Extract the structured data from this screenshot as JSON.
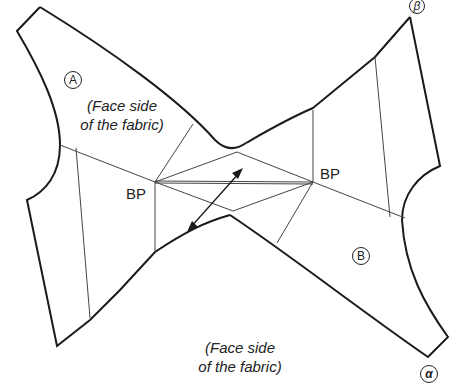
{
  "diagram": {
    "type": "sewing-pattern",
    "pieces": [
      {
        "id": "A",
        "marker": "A",
        "note_line1": "(Face side",
        "note_line2": "of the fabric)"
      },
      {
        "id": "B",
        "marker": "B"
      }
    ],
    "bottom_note": {
      "line1": "(Face side",
      "line2": "of the fabric)"
    },
    "points": {
      "bp_left": "BP",
      "bp_right": "BP",
      "corner_beta": "β",
      "corner_alpha": "α"
    },
    "arrow": "grainline-double-arrow",
    "colors": {
      "outline": "#1a1a1a",
      "guide": "#444444",
      "background": "#ffffff"
    }
  }
}
